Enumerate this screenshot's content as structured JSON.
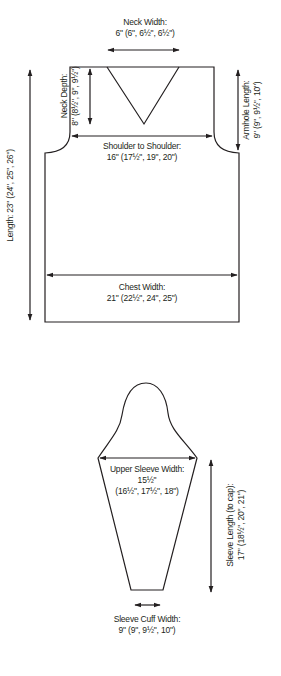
{
  "diagram": {
    "stroke_color": "#231f20",
    "body": {
      "neck_width": {
        "label": "Neck Width:",
        "value": "6\" (6\", 6½\", 6½\")"
      },
      "neck_depth": {
        "label": "Neck Depth:",
        "value": "8\" (8½\", 9\", 9½\")"
      },
      "armhole_length": {
        "label": "Armhole Length:",
        "value": "9\" (9\", 9½\", 10\")"
      },
      "shoulder_to_shoulder": {
        "label": "Shoulder to Shoulder:",
        "value": "16\" (17½\", 19\", 20\")"
      },
      "length": {
        "label": "Length: 23\" (24\", 25\", 26\")"
      },
      "chest_width": {
        "label": "Chest Width:",
        "value": "21\" (22½\", 24\", 25\")"
      }
    },
    "sleeve": {
      "upper_sleeve_width": {
        "label": "Upper Sleeve Width:",
        "value1": "15½\"",
        "value2": "(16½\", 17½\", 18\")"
      },
      "sleeve_length": {
        "label": "Sleeve Length (to cap):",
        "value": "17\" (18½\", 20\", 21\")"
      },
      "cuff_width": {
        "label": "Sleeve Cuff Width:",
        "value": "9\" (9\", 9½\", 10\")"
      }
    }
  }
}
